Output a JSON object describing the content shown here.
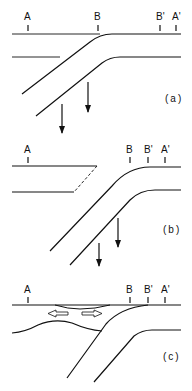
{
  "panels": [
    {
      "id": "a",
      "caption": "(a)",
      "labels": {
        "A": "A",
        "B": "B",
        "B_prime": "B'",
        "A_prime": "A'"
      }
    },
    {
      "id": "b",
      "caption": "(b)",
      "labels": {
        "A": "A",
        "B": "B",
        "B_prime": "B'",
        "A_prime": "A'"
      }
    },
    {
      "id": "c",
      "caption": "(c)",
      "labels": {
        "A": "A",
        "B": "B",
        "B_prime": "B'",
        "A_prime": "A'"
      }
    }
  ],
  "colors": {
    "line": "#111111",
    "background": "#ffffff"
  }
}
